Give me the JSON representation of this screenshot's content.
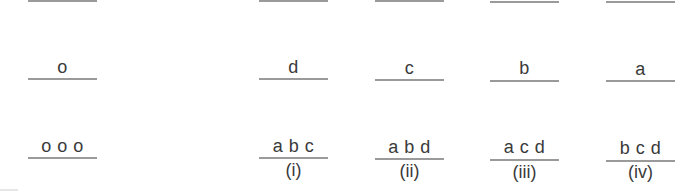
{
  "figure": {
    "columns": [
      {
        "id": "reference",
        "rows": [
          "",
          "o",
          "o o o"
        ],
        "label": ""
      },
      {
        "id": "i",
        "rows": [
          "",
          "d",
          "a b c"
        ],
        "label": "(i)"
      },
      {
        "id": "ii",
        "rows": [
          "",
          "c",
          "a b d"
        ],
        "label": "(ii)"
      },
      {
        "id": "iii",
        "rows": [
          "",
          "b",
          "a c d"
        ],
        "label": "(iii)"
      },
      {
        "id": "iv",
        "rows": [
          "",
          "a",
          "b c d"
        ],
        "label": "(iv)"
      }
    ],
    "colors": {
      "text": "#3a3a3a",
      "rule": "#9a9a9a",
      "background": "#ffffff"
    }
  }
}
